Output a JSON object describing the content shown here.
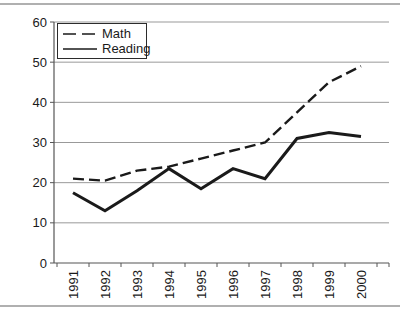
{
  "chart_data": {
    "type": "line",
    "title": "",
    "xlabel": "",
    "ylabel": "",
    "x": [
      "1991",
      "1992",
      "1993",
      "1994",
      "1995",
      "1996",
      "1997",
      "1998",
      "1999",
      "2000"
    ],
    "series": [
      {
        "name": "Math",
        "line_style": "dashed",
        "values": [
          21,
          20.5,
          23,
          24,
          26,
          28,
          30,
          37.5,
          45,
          49
        ]
      },
      {
        "name": "Reading",
        "line_style": "solid",
        "values": [
          17.5,
          13,
          18,
          23.5,
          18.5,
          23.5,
          21,
          31,
          32.5,
          31.5
        ]
      }
    ],
    "ylim": [
      0,
      60
    ],
    "yticks": [
      0,
      10,
      20,
      30,
      40,
      50,
      60
    ],
    "x_tick_label_rotation": -90,
    "grid": true,
    "legend": {
      "position": "top-left",
      "entries": [
        "Math",
        "Reading"
      ]
    },
    "colors": {
      "line": "#1a1a1a",
      "grid": "#999999",
      "axis": "#555555",
      "text": "#1a1a1a",
      "legend_border": "#2b2b2b",
      "rule": "#b0b0b0",
      "background": "#ffffff"
    }
  }
}
